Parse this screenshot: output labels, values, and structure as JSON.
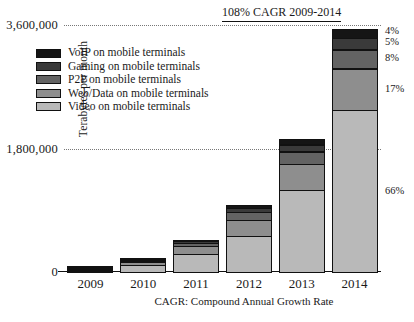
{
  "chart_data": {
    "type": "bar",
    "stacked": true,
    "title": "",
    "annotation": "108% CAGR 2009-2014",
    "footnote": "CAGR: Compound Annual Growth Rate",
    "xlabel": "",
    "ylabel": "Terabytes per month",
    "categories": [
      "2009",
      "2010",
      "2011",
      "2012",
      "2013",
      "2014"
    ],
    "ylim": [
      0,
      3600000
    ],
    "yticks": [
      0,
      1800000,
      3600000
    ],
    "ytick_labels": [
      "0",
      "1,800,000",
      "3,600,000"
    ],
    "grid": "horizontal-dotted",
    "legend_position": "upper-left",
    "series": [
      {
        "name": "VoIP on mobile terminals",
        "color": "#151515",
        "values": [
          6000,
          14000,
          30000,
          62000,
          96000,
          144000
        ]
      },
      {
        "name": "Gaming on mobile terminals",
        "color": "#3a3a3a",
        "values": [
          8000,
          18000,
          38000,
          74000,
          115000,
          180000
        ]
      },
      {
        "name": "P2P on mobile terminals",
        "color": "#636363",
        "values": [
          14000,
          30000,
          62000,
          120000,
          190000,
          288000
        ]
      },
      {
        "name": "Web/Data on mobile terminals",
        "color": "#8e8e8e",
        "values": [
          26000,
          58000,
          125000,
          250000,
          390000,
          612000
        ]
      },
      {
        "name": "Video on mobile terminals",
        "color": "#b9b9b9",
        "values": [
          36000,
          110000,
          275000,
          534000,
          1209000,
          2376000
        ]
      }
    ],
    "totals": [
      90000,
      230000,
      530000,
      1040000,
      2000000,
      3600000
    ],
    "share_labels_2014": [
      {
        "series": "VoIP on mobile terminals",
        "text": "4%"
      },
      {
        "series": "Gaming on mobile terminals",
        "text": "5%"
      },
      {
        "series": "P2P on mobile terminals",
        "text": "8%"
      },
      {
        "series": "Web/Data on mobile terminals",
        "text": "17%"
      },
      {
        "series": "Video on mobile terminals",
        "text": "66%"
      }
    ]
  }
}
